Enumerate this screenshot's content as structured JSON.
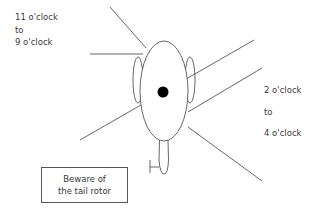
{
  "diagram": {
    "left_label": {
      "line1": "11 o'clock",
      "line2": "to",
      "line3": "9 o'clock"
    },
    "right_label": {
      "line1": "2 o'clock",
      "line2": "to",
      "line3": "4 o'clock"
    },
    "warning_box": {
      "line1": "Beware of",
      "line2": "the tail rotor"
    },
    "colors": {
      "stroke": "#555555",
      "rotor_hub": "#000000",
      "text": "#3a3a3a"
    }
  }
}
